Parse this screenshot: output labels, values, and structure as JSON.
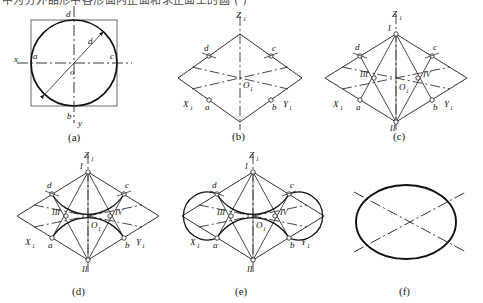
{
  "document": {
    "top_note": "中为分外品形中各形面内正面和求正面上的圆  ( )",
    "figure_type": "isometric-ellipse-construction"
  },
  "panels": [
    {
      "id": "a",
      "caption": "(a)",
      "description": "circle inscribed in square with x-y axes and diameter",
      "labels": {
        "axis_x": "x",
        "axis_y": "y",
        "center": "o",
        "left": "a",
        "bottom": "b",
        "right": "c",
        "top": "d",
        "diameter": "d"
      }
    },
    {
      "id": "b",
      "caption": "(b)",
      "description": "isometric rhombus with tangent point markers",
      "labels": {
        "axis_z": "Z",
        "axis_z_sub": "1",
        "axis_x": "X",
        "axis_x_sub": "1",
        "axis_y": "Y",
        "axis_y_sub": "1",
        "origin": "O",
        "origin_sub": "1",
        "p_a": "a",
        "p_b": "b",
        "p_c": "c",
        "p_d": "d"
      }
    },
    {
      "id": "c",
      "caption": "(c)",
      "description": "rhombus with four arc centers located",
      "labels": {
        "axis_z": "Z",
        "axis_z_sub": "1",
        "axis_x": "X",
        "axis_x_sub": "1",
        "axis_y": "Y",
        "axis_y_sub": "1",
        "origin": "O",
        "origin_sub": "1",
        "p_a": "a",
        "p_b": "b",
        "p_c": "c",
        "p_d": "d",
        "c1": "I",
        "c2": "II",
        "c3": "III",
        "c4": "IV"
      }
    },
    {
      "id": "d",
      "caption": "(d)",
      "description": "two large arcs drawn from centers I and II",
      "labels": {
        "axis_z": "Z",
        "axis_z_sub": "1",
        "axis_x": "X",
        "axis_x_sub": "1",
        "axis_y": "Y",
        "axis_y_sub": "1",
        "origin": "O",
        "origin_sub": "1",
        "p_a": "a",
        "p_b": "b",
        "p_c": "c",
        "p_d": "d",
        "c1": "I",
        "c2": "II",
        "c3": "III",
        "c4": "IV"
      }
    },
    {
      "id": "e",
      "caption": "(e)",
      "description": "all four arcs completed forming the approximate ellipse",
      "labels": {
        "axis_z": "Z",
        "axis_z_sub": "1",
        "axis_x": "X",
        "axis_x_sub": "1",
        "axis_y": "Y",
        "axis_y_sub": "1",
        "origin": "O",
        "origin_sub": "1",
        "p_a": "a",
        "p_b": "b",
        "p_c": "c",
        "p_d": "d",
        "c1": "I",
        "c2": "II",
        "c3": "III",
        "c4": "IV"
      }
    },
    {
      "id": "f",
      "caption": "(f)",
      "description": "finished isometric ellipse with centre lines",
      "labels": {}
    }
  ],
  "style": {
    "stroke": "#111111",
    "thin_stroke": "#3a3a3a",
    "bg": "#ffffff"
  }
}
